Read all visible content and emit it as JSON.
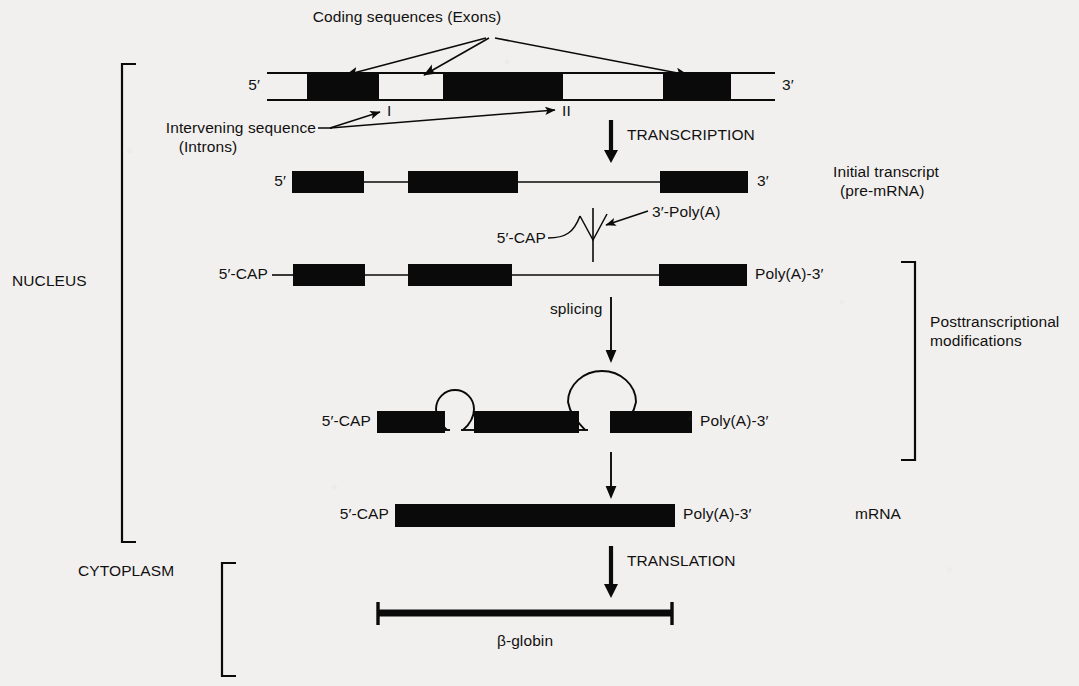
{
  "figure": {
    "title_text": "Coding sequences (Exons)",
    "background_color": "#f2f0ee",
    "ink_color": "#0a0a0a"
  },
  "labels": {
    "coding_sequences": "Coding sequences (Exons)",
    "intervening_sequence": "Intervening sequence",
    "introns": "(Introns)",
    "intron_one": "I",
    "intron_two": "II",
    "transcription": "TRANSCRIPTION",
    "translation": "TRANSLATION",
    "splicing": "splicing",
    "nucleus": "NUCLEUS",
    "cytoplasm": "CYTOPLASM",
    "initial_transcript_line1": "Initial transcript",
    "initial_transcript_line2": "(pre-mRNA)",
    "posttranscriptional_line1": "Posttranscriptional",
    "posttranscriptional_line2": "modifications",
    "mrna": "mRNA",
    "beta_globin": "β-globin",
    "five_prime": "5′",
    "three_prime": "3′",
    "five_prime_cap": "5′-CAP",
    "three_prime_polya": "3′-Poly(A)",
    "polya_three_prime": "Poly(A)-3′"
  },
  "rows": {
    "dna": {
      "name": "Genomic DNA (gene)",
      "y": 86,
      "left_tick": 267,
      "right_tick": 775,
      "exons": [
        {
          "name": "exon-1",
          "x": 307,
          "width": 72
        },
        {
          "name": "exon-2",
          "x": 443,
          "width": 120
        },
        {
          "name": "exon-3",
          "x": 663,
          "width": 68
        }
      ],
      "introns": [
        {
          "name": "intron-1",
          "x": 379,
          "width": 64
        },
        {
          "name": "intron-2",
          "x": 563,
          "width": 100
        }
      ]
    },
    "pre_mrna": {
      "name": "Initial transcript (pre-mRNA)",
      "y": 182,
      "exons": [
        {
          "name": "exon-1",
          "x": 292,
          "width": 72
        },
        {
          "name": "exon-2",
          "x": 408,
          "width": 110
        },
        {
          "name": "exon-3",
          "x": 660,
          "width": 88
        }
      ]
    },
    "capped": {
      "name": "Capped and polyadenylated pre-mRNA",
      "y": 275,
      "exons": [
        {
          "name": "exon-1",
          "x": 293,
          "width": 72
        },
        {
          "name": "exon-2",
          "x": 408,
          "width": 104
        },
        {
          "name": "exon-3",
          "x": 659,
          "width": 88
        }
      ]
    },
    "spliced": {
      "name": "Splicing intermediate with intron lariats",
      "y": 422,
      "exons": [
        {
          "name": "exon-1",
          "x": 377,
          "width": 68
        },
        {
          "name": "exon-2",
          "x": 474,
          "width": 105
        },
        {
          "name": "exon-3",
          "x": 610,
          "width": 82
        }
      ],
      "loops": [
        {
          "name": "intron-loop-1-small",
          "cx": 455,
          "cy": 397,
          "r": 19
        },
        {
          "name": "intron-loop-2-large",
          "cx": 595,
          "cy": 380,
          "r": 34
        }
      ]
    },
    "mature_mrna": {
      "name": "Mature mRNA",
      "y": 515,
      "bar": {
        "x": 395,
        "width": 280
      }
    },
    "protein": {
      "name": "Beta-globin polypeptide",
      "y": 613,
      "bar": {
        "x": 377,
        "width": 296
      }
    }
  },
  "brackets": {
    "nucleus": {
      "x": 122,
      "top": 64,
      "bottom": 542,
      "arm": 14
    },
    "cytoplasm": {
      "x": 222,
      "top": 563,
      "bottom": 676,
      "arm": 14
    },
    "posttranscriptional": {
      "x": 915,
      "top": 262,
      "bottom": 460,
      "arm": 14
    }
  },
  "arrows": {
    "transcription": {
      "x": 611,
      "y1": 120,
      "y2": 160
    },
    "splicing": {
      "x": 611,
      "y1": 297,
      "y2": 362
    },
    "to_mrna": {
      "x": 611,
      "y1": 452,
      "y2": 497
    },
    "translation": {
      "x": 611,
      "y1": 546,
      "y2": 597
    }
  }
}
